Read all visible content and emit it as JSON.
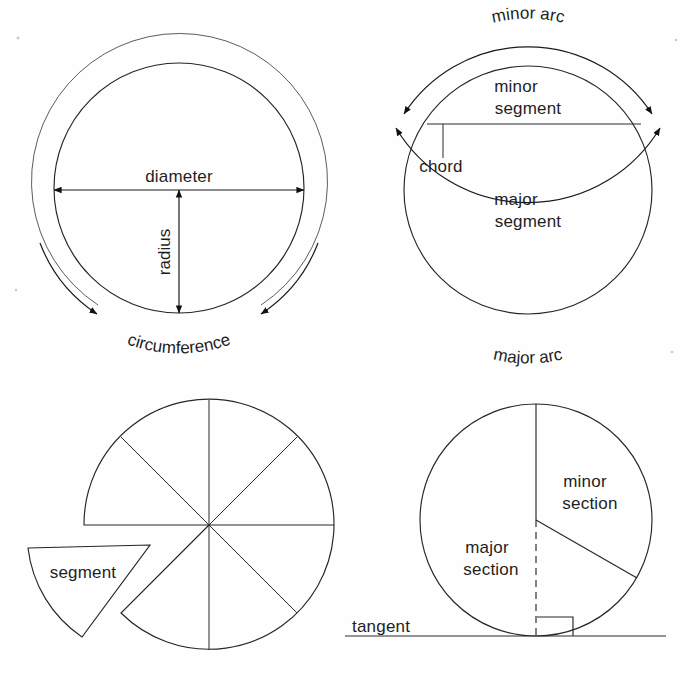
{
  "page": {
    "background_color": "#fefefe",
    "ink_color": "#1f1f1f",
    "width": 695,
    "height": 676
  },
  "figures": [
    {
      "id": "fig-diameter-radius-circumference",
      "name": "diameter-radius-circumference-figure",
      "position": "top-left",
      "center": [
        179,
        188
      ],
      "inner_radius": 125,
      "outer_radius": 148,
      "labels": [
        {
          "key": "diameter",
          "text": "diameter",
          "x": 179,
          "y": 182
        },
        {
          "key": "radius",
          "text": "radius",
          "x": 170,
          "y": 252
        },
        {
          "key": "circumference",
          "text": "circumference",
          "x": 175,
          "y": 345
        }
      ],
      "measures": {
        "diameter_line": {
          "x1": 54,
          "y1": 190,
          "x2": 304,
          "y2": 190
        },
        "radius_line": {
          "x1": 179,
          "y1": 190,
          "x2": 179,
          "y2": 313
        }
      }
    },
    {
      "id": "fig-arcs-segments",
      "name": "arcs-and-segments-figure",
      "position": "top-right",
      "center": [
        528,
        190
      ],
      "inner_radius": 124,
      "outer_radius": 148,
      "labels": [
        {
          "key": "minor_arc",
          "text": "minor arc",
          "x": 528,
          "y": 42
        },
        {
          "key": "minor_segment_line1",
          "text": "minor",
          "x": 516,
          "y": 92
        },
        {
          "key": "minor_segment_line2",
          "text": "segment",
          "x": 528,
          "y": 113
        },
        {
          "key": "chord",
          "text": "chord",
          "x": 441,
          "y": 172
        },
        {
          "key": "major_segment_line1",
          "text": "major",
          "x": 516,
          "y": 205
        },
        {
          "key": "major_segment_line2",
          "text": "segment",
          "x": 528,
          "y": 226
        },
        {
          "key": "major_arc",
          "text": "major arc",
          "x": 528,
          "y": 334
        }
      ],
      "measures": {
        "chord_line": {
          "x1": 427,
          "y1": 124,
          "x2": 641,
          "y2": 124
        },
        "chord_leader": {
          "x1": 443,
          "y1": 124,
          "x2": 443,
          "y2": 158
        }
      }
    },
    {
      "id": "fig-segment-sectors",
      "name": "segment-sectors-figure",
      "position": "bottom-left",
      "center": [
        209,
        525
      ],
      "radius": 125,
      "sector_count": 8,
      "sector_angle_degrees": 45,
      "removed_sector": {
        "start_angle": 180,
        "end_angle": 225
      },
      "labels": [
        {
          "key": "segment",
          "text": "segment",
          "x": 83,
          "y": 572
        }
      ],
      "detached_segment": {
        "apex": [
          150,
          545
        ],
        "flat_end": [
          28,
          548
        ],
        "arc_tip": [
          82,
          637
        ]
      }
    },
    {
      "id": "fig-sections-tangent",
      "name": "sections-and-tangent-figure",
      "position": "bottom-right",
      "center": [
        536,
        520
      ],
      "radius": 116,
      "labels": [
        {
          "key": "minor_section_line1",
          "text": "minor",
          "x": 585,
          "y": 481
        },
        {
          "key": "minor_section_line2",
          "text": "section",
          "x": 590,
          "y": 503
        },
        {
          "key": "major_section_line1",
          "text": "major",
          "x": 487,
          "y": 547
        },
        {
          "key": "major_section_line2",
          "text": "section",
          "x": 491,
          "y": 569
        },
        {
          "key": "tangent",
          "text": "tangent",
          "x": 352,
          "y": 626
        }
      ],
      "measures": {
        "radius_up": {
          "x1": 536,
          "y1": 520,
          "x2": 536,
          "y2": 404
        },
        "radius_down_right": {
          "x1": 536,
          "y1": 520,
          "x2": 637,
          "y2": 578
        },
        "dashed_radius": {
          "x1": 536,
          "y1": 520,
          "x2": 536,
          "y2": 636
        },
        "tangent_line": {
          "x1": 345,
          "y1": 636,
          "x2": 666,
          "y2": 636
        },
        "right_angle_box": {
          "x": 537,
          "y": 617,
          "size": 36
        }
      }
    }
  ],
  "glossary_terms": [
    "diameter",
    "radius",
    "circumference",
    "minor arc",
    "major arc",
    "minor segment",
    "major segment",
    "chord",
    "segment",
    "minor section",
    "major section",
    "tangent"
  ]
}
